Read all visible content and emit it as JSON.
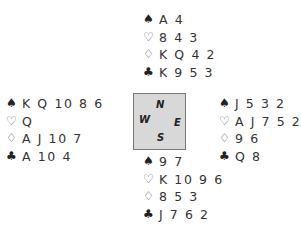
{
  "diagram": {
    "type": "bridge-deal",
    "suit_symbols": {
      "spades": "♠",
      "hearts": "♡",
      "diamonds": "♢",
      "clubs": "♣"
    },
    "hands": {
      "north": {
        "spades": "A 4",
        "hearts": "8 4 3",
        "diamonds": "K Q 4 2",
        "clubs": "K 9 5 3"
      },
      "west": {
        "spades": "K Q 10 8 6",
        "hearts": "Q",
        "diamonds": "A J 10 7",
        "clubs": "A 10 4"
      },
      "east": {
        "spades": "J 5 3 2",
        "hearts": "A J 7 5 2",
        "diamonds": "9 6",
        "clubs": "Q 8"
      },
      "south": {
        "spades": "9 7",
        "hearts": "K 10 9 6",
        "diamonds": "8 5 3",
        "clubs": "J 7 6 2"
      }
    },
    "compass": {
      "north": "N",
      "south": "S",
      "west": "W",
      "east": "E",
      "fill_color": "#d8d8d8",
      "border_color": "#777777"
    }
  }
}
